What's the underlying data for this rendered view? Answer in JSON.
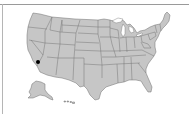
{
  "map": {
    "region": "United States",
    "style": {
      "land_color": "#c6c6c6",
      "border_color": "#6e6e6e",
      "background_color": "#ffffff",
      "marker_color": "#000000"
    },
    "insets": [
      "Alaska",
      "Hawaii"
    ],
    "markers": [
      {
        "label": "Southern California",
        "state": "California",
        "x": 37,
        "y": 62
      }
    ]
  }
}
